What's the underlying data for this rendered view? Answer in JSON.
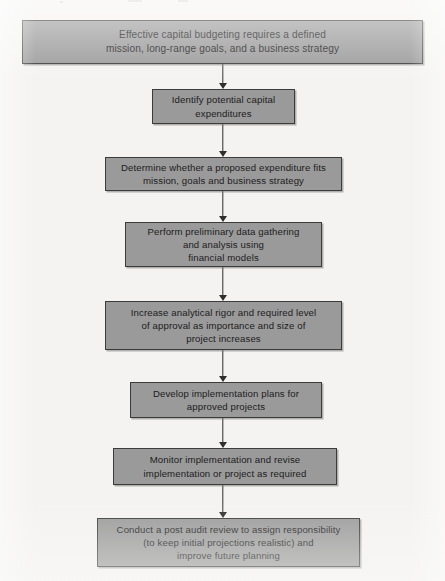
{
  "diagram": {
    "type": "flowchart",
    "orientation": "vertical-top-down",
    "colors": {
      "background": "#f4f3f1",
      "node_fill": "#9a9a9a",
      "node_border": "#3b3b3b",
      "text": "#1c1c1c",
      "connector": "#2f2f2f"
    },
    "nodes": [
      {
        "id": "node-1",
        "text": "Effective capital budgeting requires a defined\nmission, long-range goals, and a business strategy"
      },
      {
        "id": "node-2",
        "text": "Identify potential capital\nexpenditures"
      },
      {
        "id": "node-3",
        "text": "Determine whether a proposed expenditure fits\nmission, goals and business strategy"
      },
      {
        "id": "node-4",
        "text": "Perform preliminary data gathering\nand analysis using\nfinancial models"
      },
      {
        "id": "node-5",
        "text": "Increase analytical rigor and required level\nof approval as importance and size of\nproject increases"
      },
      {
        "id": "node-6",
        "text": "Develop implementation plans for\napproved projects"
      },
      {
        "id": "node-7",
        "text": "Monitor implementation and revise\nimplementation or project as required"
      },
      {
        "id": "node-8",
        "text": "Conduct a post audit review to assign responsibility\n(to keep initial projections realistic) and\nimprove future planning"
      }
    ],
    "connectors": [
      {
        "id": "connector-1-2",
        "from": "node-1",
        "to": "node-2",
        "arrow": "down"
      },
      {
        "id": "connector-2-3",
        "from": "node-2",
        "to": "node-3",
        "arrow": "down"
      },
      {
        "id": "connector-3-4",
        "from": "node-3",
        "to": "node-4",
        "arrow": "down"
      },
      {
        "id": "connector-4-5",
        "from": "node-4",
        "to": "node-5",
        "arrow": "down"
      },
      {
        "id": "connector-5-6",
        "from": "node-5",
        "to": "node-6",
        "arrow": "down"
      },
      {
        "id": "connector-6-7",
        "from": "node-6",
        "to": "node-7",
        "arrow": "down"
      },
      {
        "id": "connector-7-8",
        "from": "node-7",
        "to": "node-8",
        "arrow": "down"
      }
    ]
  }
}
